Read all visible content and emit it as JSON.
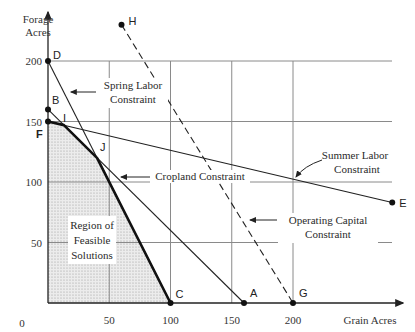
{
  "chart_data": {
    "type": "line",
    "title": "",
    "xlabel": "Grain Acres",
    "ylabel": "Forage Acres",
    "ylabel_lines": [
      "Forage",
      "Acres"
    ],
    "xlim": [
      0,
      280
    ],
    "ylim": [
      0,
      230
    ],
    "x_ticks": [
      0,
      50,
      100,
      150,
      200
    ],
    "y_ticks": [
      50,
      100,
      150,
      200
    ],
    "grid": true,
    "grid_x": [
      50,
      100,
      150,
      200
    ],
    "grid_y": [
      50,
      100,
      150,
      200
    ],
    "points": [
      {
        "name": "D",
        "x": 0,
        "y": 200
      },
      {
        "name": "B",
        "x": 0,
        "y": 160
      },
      {
        "name": "F",
        "x": 0,
        "y": 150
      },
      {
        "name": "I",
        "x": 13,
        "y": 147
      },
      {
        "name": "J",
        "x": 40,
        "y": 120
      },
      {
        "name": "C",
        "x": 100,
        "y": 0
      },
      {
        "name": "A",
        "x": 160,
        "y": 0
      },
      {
        "name": "G",
        "x": 200,
        "y": 0
      },
      {
        "name": "H",
        "x": 60,
        "y": 230
      },
      {
        "name": "E",
        "x": 281,
        "y": 83
      }
    ],
    "series": [
      {
        "name": "Spring Labor Constraint",
        "style": "solid",
        "from": [
          0,
          200
        ],
        "to": [
          100,
          0
        ]
      },
      {
        "name": "Cropland Constraint",
        "style": "solid",
        "from": [
          0,
          160
        ],
        "to": [
          160,
          0
        ]
      },
      {
        "name": "Summer Labor Constraint",
        "style": "solid",
        "from": [
          0,
          150
        ],
        "to": [
          281,
          83
        ]
      },
      {
        "name": "Operating Capital Constraint",
        "style": "dashed",
        "from": [
          60,
          230
        ],
        "to": [
          200,
          0
        ]
      }
    ],
    "feasible_region": {
      "label_lines": [
        "Region of",
        "Feasible",
        "Solutions"
      ],
      "vertices": [
        [
          0,
          0
        ],
        [
          0,
          150
        ],
        [
          13,
          147
        ],
        [
          40,
          120
        ],
        [
          100,
          0
        ]
      ]
    },
    "annotations": [
      {
        "text_lines": [
          "Spring Labor",
          "Constraint"
        ],
        "arrow_to": [
          17,
          166
        ]
      },
      {
        "text_lines": [
          "Cropland Constraint"
        ],
        "arrow_to": [
          0,
          160
        ]
      },
      {
        "text_lines": [
          "Summer Labor",
          "Constraint"
        ],
        "arrow_to": [
          200,
          102
        ]
      },
      {
        "text_lines": [
          "Operating Capital",
          "Constraint"
        ],
        "arrow_to": [
          184,
          25
        ]
      }
    ]
  }
}
